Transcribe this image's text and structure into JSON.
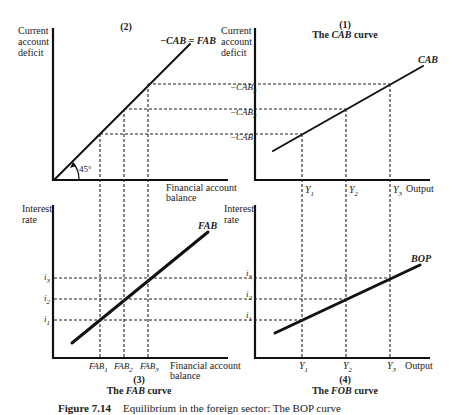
{
  "figure": {
    "caption_number": "Figure 7.14",
    "caption_text": "Equilibrium in the foreign sector: The BOP curve"
  },
  "panels": {
    "p2": {
      "number": "(2)",
      "y_label": [
        "Current",
        "account",
        "deficit"
      ],
      "x_label": [
        "Financial account",
        "balance"
      ],
      "line_label": "−CAB = FAB",
      "angle_label": "45°"
    },
    "p1": {
      "number": "(1)",
      "title_pre": "The ",
      "title_it": "CAB",
      "title_post": " curve",
      "y_label": [
        "Current",
        "account",
        "deficit"
      ],
      "x_label": "Output",
      "line_label": "CAB",
      "y_ticks": [
        "−CAB",
        "−CAB",
        "−CAB"
      ],
      "y_tick_subs": [
        "3",
        "2",
        "1"
      ],
      "x_ticks": [
        "Y",
        "Y",
        "Y"
      ],
      "x_tick_subs": [
        "1",
        "2",
        "3"
      ]
    },
    "p3": {
      "number": "(3)",
      "title_pre": "The ",
      "title_it": "FAB",
      "title_post": " curve",
      "y_label": [
        "Interest",
        "rate"
      ],
      "x_label": [
        "Financial account",
        "balance"
      ],
      "line_label": "FAB",
      "y_ticks": [
        "i",
        "i",
        "i"
      ],
      "y_tick_subs": [
        "3",
        "2",
        "1"
      ],
      "x_ticks": [
        "FAB",
        "FAB",
        "FAB"
      ],
      "x_tick_subs": [
        "1",
        "2",
        "3"
      ]
    },
    "p4": {
      "number": "(4)",
      "title_pre": "The ",
      "title_it": "FOB",
      "title_post": " curve",
      "y_label": [
        "Interest",
        "rate"
      ],
      "x_label": "Output",
      "line_label": "BOP",
      "y_ticks": [
        "i",
        "i",
        "i"
      ],
      "y_tick_subs": [
        "3",
        "2",
        "1"
      ],
      "x_ticks": [
        "Y",
        "Y",
        "Y"
      ],
      "x_tick_subs": [
        "1",
        "2",
        "3"
      ]
    }
  }
}
